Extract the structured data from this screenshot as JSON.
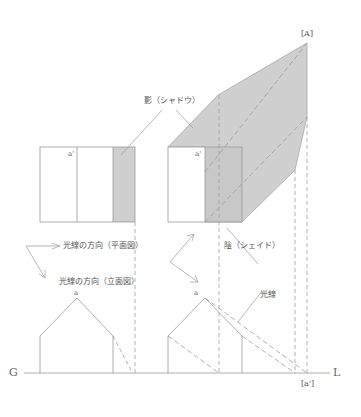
{
  "diagram": {
    "colors": {
      "shade": "#cfcfcf",
      "line": "#9a9a9a",
      "dash": "#9a9a9a",
      "text": "#555555"
    },
    "labels": {
      "point_A": "[A]",
      "point_a_plan_left": "a'",
      "point_a_plan_right": "a'",
      "point_a_elev_left": "a",
      "point_a_elev_right": "a",
      "point_a_prime_ground": "[a']",
      "shadow": "影（シャドウ）",
      "shade": "陰（シェイド）",
      "light_dir_plan": "光線の方向（平面図）",
      "light_dir_elev": "光線の方向（立面図）",
      "light_ray": "光線",
      "ground_G": "G",
      "ground_L": "L"
    }
  }
}
